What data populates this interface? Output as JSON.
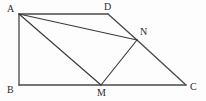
{
  "figure": {
    "background_color": "#fdfdfd",
    "line_color": "#3a3a3a",
    "label_color": "#2b2b2b",
    "width": 206,
    "height": 101,
    "vertices": [
      {
        "id": "A",
        "label": "A",
        "x": 19,
        "y": 14,
        "label_x": 7,
        "label_y": 4
      },
      {
        "id": "D",
        "label": "D",
        "x": 108,
        "y": 14,
        "label_x": 104,
        "label_y": 2
      },
      {
        "id": "N",
        "label": "N",
        "x": 137,
        "y": 40,
        "label_x": 140,
        "label_y": 27
      },
      {
        "id": "C",
        "label": "C",
        "x": 186,
        "y": 85,
        "label_x": 190,
        "label_y": 82
      },
      {
        "id": "M",
        "label": "M",
        "x": 101,
        "y": 85,
        "label_x": 97,
        "label_y": 88
      },
      {
        "id": "B",
        "label": "B",
        "x": 19,
        "y": 85,
        "label_x": 7,
        "label_y": 85
      }
    ],
    "edges": [
      {
        "id": "AB",
        "from": "A",
        "to": "B",
        "kind": "frame"
      },
      {
        "id": "BC",
        "from": "B",
        "to": "C",
        "kind": "frame"
      },
      {
        "id": "AD",
        "from": "A",
        "to": "D",
        "kind": "frame"
      },
      {
        "id": "DN",
        "from": "D",
        "to": "N",
        "kind": "frame"
      },
      {
        "id": "NC",
        "from": "N",
        "to": "C",
        "kind": "frame"
      },
      {
        "id": "AN",
        "from": "A",
        "to": "N",
        "kind": "inner"
      },
      {
        "id": "AM",
        "from": "A",
        "to": "M",
        "kind": "inner"
      },
      {
        "id": "MN",
        "from": "M",
        "to": "N",
        "kind": "inner"
      }
    ]
  }
}
